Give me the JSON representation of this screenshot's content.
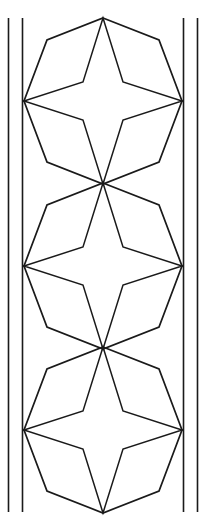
{
  "figure": {
    "kind": "line-drawing",
    "width": 206,
    "height": 525,
    "background_color": "#ffffff",
    "stroke_color": "#1a1a1a"
  },
  "border_rules": {
    "label": "Double vertical rules",
    "stroke_width": 1.6,
    "y_top": 18,
    "y_bottom": 512,
    "left": {
      "outer_x": 8.5,
      "inner_x": 22.5
    },
    "right": {
      "inner_x": 183.5,
      "outer_x": 197.5
    }
  },
  "motif": {
    "label": "Hexagon with inscribed four-pointed star",
    "count": 3,
    "centers_y": [
      101,
      266,
      430
    ],
    "center_x": 103,
    "junction_points_y": [
      18,
      185,
      350,
      508
    ],
    "hexagon": {
      "label": "Elongated hexagon outline",
      "stroke_width": 1.7,
      "half_width": 79,
      "half_height": 83,
      "shoulder_dx": 56,
      "shoulder_dy": 61
    },
    "star": {
      "label": "Four-pointed star",
      "stroke_width": 1.5,
      "point_up_dy": 83,
      "point_side_dx": 79,
      "waist_dx": 20,
      "waist_dy": 19
    },
    "spokes": {
      "label": "Radiating spokes at junctions",
      "stroke_width": 1.5
    }
  },
  "colors": {
    "ink": "#1a1a1a",
    "paper": "#ffffff"
  }
}
